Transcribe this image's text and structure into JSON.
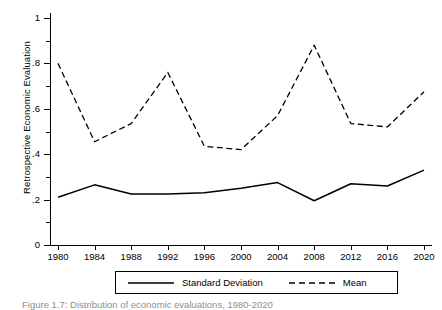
{
  "chart_data": {
    "type": "line",
    "title": "",
    "xlabel": "",
    "ylabel": "Retrospective Economic Evaluation",
    "x": [
      1980,
      1984,
      1988,
      1992,
      1996,
      2000,
      2004,
      2008,
      2012,
      2016,
      2020
    ],
    "xtick_labels": [
      "1980",
      "1984",
      "1988",
      "1992",
      "1996",
      "2000",
      "2004",
      "2008",
      "2012",
      "2016",
      "2020"
    ],
    "ytick_labels": [
      "0",
      ".2",
      ".4",
      ".6",
      ".8",
      "1"
    ],
    "ytick_values": [
      0,
      0.2,
      0.4,
      0.6,
      0.8,
      1
    ],
    "yminor_values": [
      0.1,
      0.3,
      0.5,
      0.7,
      0.9
    ],
    "xlim": [
      1980,
      2020
    ],
    "ylim": [
      0,
      1
    ],
    "grid": false,
    "legend_position": "bottom",
    "series": [
      {
        "name": "Standard Deviation",
        "style": "solid",
        "color": "#000000",
        "values": [
          0.21,
          0.265,
          0.225,
          0.225,
          0.23,
          0.25,
          0.275,
          0.195,
          0.27,
          0.26,
          0.33
        ]
      },
      {
        "name": "Mean",
        "style": "dashed",
        "color": "#000000",
        "values": [
          0.8,
          0.455,
          0.535,
          0.76,
          0.435,
          0.42,
          0.57,
          0.88,
          0.535,
          0.52,
          0.675
        ]
      }
    ]
  },
  "legend": {
    "entries": [
      {
        "label": "Standard Deviation",
        "style": "solid"
      },
      {
        "label": "Mean",
        "style": "dashed"
      }
    ]
  },
  "caption": {
    "text": "Figure 1.7: Distribution of economic evaluations, 1980-2020"
  }
}
